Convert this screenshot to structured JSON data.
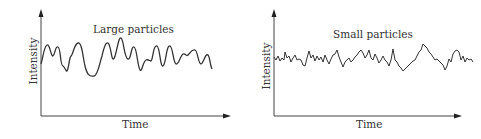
{
  "panels": [
    {
      "title": "Large particles",
      "xlabel": "Time",
      "ylabel": "Intensity",
      "signal": "large slow fluctuations"
    },
    {
      "title": "Small particles",
      "xlabel": "Time",
      "ylabel": "Intensity",
      "signal": "small rapid fluctuations"
    }
  ],
  "colors": {
    "axis": "#444444",
    "trace": "#333333",
    "text": "#333333"
  }
}
